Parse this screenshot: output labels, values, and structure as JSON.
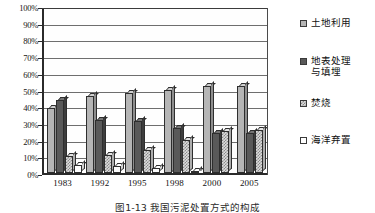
{
  "chart_data": {
    "type": "bar",
    "title": "",
    "xlabel": "",
    "ylabel": "",
    "ylim": [
      0,
      100
    ],
    "ytick_labels": [
      "0%",
      "10%",
      "20%",
      "30%",
      "40%",
      "50%",
      "60%",
      "70%",
      "80%",
      "90%",
      "100%"
    ],
    "ytick_values": [
      0,
      10,
      20,
      30,
      40,
      50,
      60,
      70,
      80,
      90,
      100
    ],
    "grid": true,
    "legend_position": "right",
    "categories": [
      "1983",
      "1992",
      "1995",
      "1998",
      "2000",
      "2005"
    ],
    "series": [
      {
        "name": "土地利用",
        "values": [
          39,
          46,
          48,
          50,
          52,
          52
        ]
      },
      {
        "name": "地表处理\n与填埋",
        "values": [
          44,
          32,
          31,
          27,
          24,
          24
        ]
      },
      {
        "name": "焚烧",
        "values": [
          10,
          11,
          14,
          20,
          25,
          26
        ]
      },
      {
        "name": "海洋弃置",
        "values": [
          5,
          4,
          3,
          1,
          0,
          0
        ]
      }
    ]
  },
  "legend": {
    "items": [
      {
        "label": "土地利用",
        "swatch": "legend-swatch-land-use"
      },
      {
        "label": "地表处理\n与填埋",
        "swatch": "legend-swatch-landfill"
      },
      {
        "label": "焚烧",
        "swatch": "legend-swatch-incineration"
      },
      {
        "label": "海洋弃置",
        "swatch": "legend-swatch-ocean-dumping"
      }
    ]
  },
  "caption": {
    "text": "图1-13  我国污泥处置方式的构成"
  },
  "colors": {
    "land_use": "#b5b5b5",
    "landfill": "#595959",
    "incineration": "#dcdcdc",
    "ocean_dumping": "#ffffff",
    "axis": "#2a2a2a",
    "grid": "#6e6e6e"
  }
}
